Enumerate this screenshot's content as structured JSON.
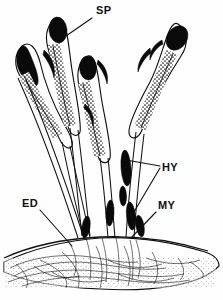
{
  "figure": {
    "kind": "biological-line-drawing",
    "background_color": "#fefefe",
    "ink_color": "#111111"
  },
  "labels": [
    {
      "id": "sp",
      "text": "SP",
      "meaning": "sporangium",
      "x": 96,
      "y": 14
    },
    {
      "id": "hy",
      "text": "HY",
      "meaning": "hypha",
      "x": 162,
      "y": 171
    },
    {
      "id": "my",
      "text": "MY",
      "meaning": "mycelium",
      "x": 158,
      "y": 209
    },
    {
      "id": "ed",
      "text": "ED",
      "meaning": "substrate surface",
      "x": 22,
      "y": 207
    }
  ],
  "leaders": [
    {
      "id": "sp-leader",
      "from": [
        92,
        18
      ],
      "to": [
        66,
        36
      ]
    },
    {
      "id": "hy-leader-a",
      "from": [
        160,
        166
      ],
      "to": [
        126,
        160
      ]
    },
    {
      "id": "hy-leader-b",
      "from": [
        160,
        168
      ],
      "to": [
        131,
        217
      ]
    },
    {
      "id": "my-leader",
      "from": [
        156,
        212
      ],
      "to": [
        131,
        237
      ]
    },
    {
      "id": "ed-leader",
      "from": [
        40,
        210
      ],
      "to": [
        72,
        245
      ]
    }
  ],
  "structures": {
    "sporangia_count": 4,
    "sporangia": [
      {
        "id": "sporangium-left",
        "tip": [
          22,
          44
        ],
        "tilt": "left"
      },
      {
        "id": "sporangium-upper",
        "tip": [
          58,
          20
        ],
        "tilt": "upright"
      },
      {
        "id": "sporangium-middle",
        "tip": [
          88,
          58
        ],
        "tilt": "upright"
      },
      {
        "id": "sporangium-right",
        "tip": [
          176,
          26
        ],
        "tilt": "right"
      }
    ],
    "hyphae_spindles": 6,
    "substrate": {
      "top_edge_y": 240,
      "bottom_edge_y": 288
    }
  }
}
